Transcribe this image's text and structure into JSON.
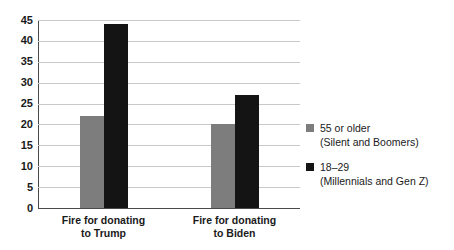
{
  "chart_data": {
    "type": "bar",
    "title": "",
    "xlabel": "",
    "ylabel": "",
    "ylim": [
      0,
      45
    ],
    "grid": true,
    "legend_position": "right",
    "categories": [
      "Fire for donating to Trump",
      "Fire for donating to Biden"
    ],
    "category_lines": [
      [
        "Fire for donating",
        "to Trump"
      ],
      [
        "Fire for donating",
        "to Biden"
      ]
    ],
    "yticks": [
      0,
      5,
      10,
      15,
      20,
      25,
      30,
      35,
      40,
      45
    ],
    "ytick_labels": [
      "0",
      "5",
      "10",
      "15",
      "20",
      "25",
      "30",
      "35",
      "40",
      "45"
    ],
    "series": [
      {
        "name": "55 or older",
        "sublabel": "(Silent and Boomers)",
        "color": "#7d7d7d",
        "values": [
          22,
          20
        ]
      },
      {
        "name": "18–29",
        "sublabel": "(Millennials and Gen Z)",
        "color": "#141414",
        "values": [
          44,
          27
        ]
      }
    ]
  }
}
